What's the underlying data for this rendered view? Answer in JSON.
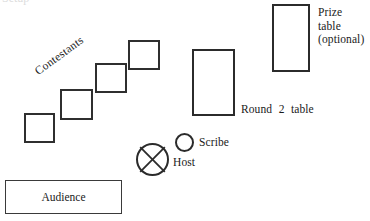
{
  "diagram": {
    "title_clipped": "Setup",
    "shapes": {
      "contestant_desks": [
        {
          "name": "contestant-desk-1",
          "x": 24,
          "y": 113,
          "w": 31,
          "h": 30
        },
        {
          "name": "contestant-desk-2",
          "x": 60,
          "y": 89,
          "w": 33,
          "h": 31
        },
        {
          "name": "contestant-desk-3",
          "x": 95,
          "y": 63,
          "w": 32,
          "h": 30
        },
        {
          "name": "contestant-desk-4",
          "x": 128,
          "y": 40,
          "w": 32,
          "h": 30
        }
      ],
      "round2_table": {
        "x": 192,
        "y": 49,
        "w": 43,
        "h": 67
      },
      "prize_table": {
        "x": 272,
        "y": 4,
        "w": 38,
        "h": 68
      },
      "audience_box": {
        "x": 5,
        "y": 180,
        "w": 117,
        "h": 34
      },
      "host_marker": {
        "x": 136,
        "y": 143,
        "d": 33
      },
      "scribe_marker": {
        "x": 175,
        "y": 133,
        "d": 19
      }
    },
    "labels": {
      "contestants": "Contestants",
      "round2_table": "Round 2 table",
      "prize_table": "Prize\ntable\n(optional)",
      "scribe": "Scribe",
      "host": "Host",
      "audience": "Audience"
    },
    "colors": {
      "stroke": "#2b2b2b",
      "text": "#1a1a1a",
      "background": "#ffffff"
    }
  }
}
